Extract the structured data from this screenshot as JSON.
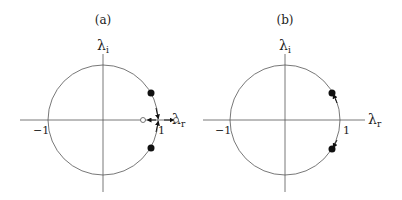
{
  "panels": [
    {
      "id": "a",
      "title": "(a)",
      "y_axis_label": "λ",
      "y_axis_sub": "i",
      "x_axis_label": "λ",
      "x_axis_sub": "r",
      "tick_neg": "−1",
      "tick_pos": "1",
      "description": "Unit circle with two complex-conjugate eigenvalues (filled dots) moving toward the real axis at +1, then splitting into two real eigenvalues (open circles) moving in opposite directions along the real axis"
    },
    {
      "id": "b",
      "title": "(b)",
      "y_axis_label": "λ",
      "y_axis_sub": "i",
      "x_axis_label": "λ",
      "x_axis_sub": "r",
      "tick_neg": "−1",
      "tick_pos": "1",
      "description": "Unit circle with two complex-conjugate eigenvalues (filled dots) moving away from the real axis along the circle"
    }
  ],
  "colors": {
    "line": "#555555",
    "marker": "#111111",
    "text": "#222222"
  }
}
